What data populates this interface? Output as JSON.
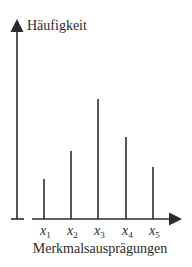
{
  "chart_data": {
    "type": "bar",
    "title": "",
    "ylabel": "Häufigkeit",
    "xlabel": "Merkmalsausprägungen",
    "categories": [
      "x1",
      "x2",
      "x3",
      "x4",
      "x5"
    ],
    "category_labels": [
      {
        "base": "x",
        "sub": "1"
      },
      {
        "base": "x",
        "sub": "2"
      },
      {
        "base": "x",
        "sub": "3"
      },
      {
        "base": "x",
        "sub": "4"
      },
      {
        "base": "x",
        "sub": "5"
      }
    ],
    "values": [
      40,
      68,
      120,
      82,
      52
    ],
    "ylim": [
      0,
      130
    ],
    "grid": false,
    "legend": "none",
    "bar_style": "stick",
    "color": "#2b2b2b"
  }
}
